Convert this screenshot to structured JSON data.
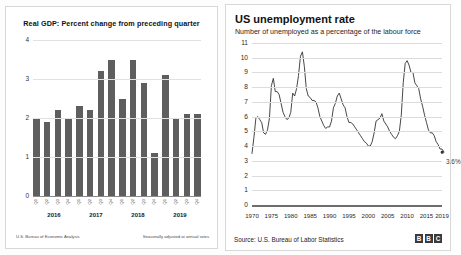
{
  "gdp": {
    "title": "Real GDP: Percent change from preceding quarter",
    "source_left": "U.S. Bureau of Economic Analysis",
    "source_right": "Seasonally adjusted at annual rates"
  },
  "unemployment": {
    "title": "US unemployment rate",
    "subtitle": "Number of unemployed as a percentage of the labour force",
    "source": "Source: U.S. Bureau of Labor Statistics",
    "logo": [
      "B",
      "B",
      "C"
    ],
    "end_label": "3.6%"
  },
  "chart_data": [
    {
      "type": "bar",
      "title": "Real GDP: Percent change from preceding quarter",
      "xlabel": "",
      "ylabel": "",
      "ylim": [
        0,
        4
      ],
      "yticks": [
        0,
        1,
        2,
        3,
        4
      ],
      "grid": true,
      "quarters": [
        "Q1",
        "Q2",
        "Q3",
        "Q4",
        "Q1",
        "Q2",
        "Q3",
        "Q4",
        "Q1",
        "Q2",
        "Q3",
        "Q4",
        "Q1",
        "Q2",
        "Q3",
        "Q4"
      ],
      "years": [
        "2016",
        "2017",
        "2018",
        "2019"
      ],
      "categories": [
        "2016 Q1",
        "2016 Q2",
        "2016 Q3",
        "2016 Q4",
        "2017 Q1",
        "2017 Q2",
        "2017 Q3",
        "2017 Q4",
        "2018 Q1",
        "2018 Q2",
        "2018 Q3",
        "2018 Q4",
        "2019 Q1",
        "2019 Q2",
        "2019 Q3",
        "2019 Q4"
      ],
      "values": [
        2.0,
        1.9,
        2.2,
        2.0,
        2.3,
        2.2,
        3.2,
        3.5,
        2.5,
        3.5,
        2.9,
        1.1,
        3.1,
        2.0,
        2.1,
        2.1
      ],
      "bar_color": "#5e5e5e"
    },
    {
      "type": "line",
      "title": "US unemployment rate",
      "subtitle": "Number of unemployed as a percentage of the labour force",
      "xlabel": "",
      "ylabel": "",
      "ylim": [
        0,
        11
      ],
      "yticks": [
        0,
        1,
        2,
        3,
        4,
        5,
        6,
        7,
        8,
        9,
        10,
        11
      ],
      "xlim": [
        1970,
        2019
      ],
      "xticks": [
        1970,
        1975,
        1980,
        1985,
        1990,
        1995,
        2000,
        2005,
        2010,
        2015,
        2019
      ],
      "grid": true,
      "line_color": "#333333",
      "annotation": {
        "x": 2019,
        "y": 3.6,
        "text": "3.6%"
      },
      "x": [
        1970,
        1970.5,
        1971,
        1971.5,
        1972,
        1972.5,
        1973,
        1973.5,
        1974,
        1974.5,
        1975,
        1975.5,
        1976,
        1976.5,
        1977,
        1977.5,
        1978,
        1978.5,
        1979,
        1979.5,
        1980,
        1980.5,
        1981,
        1981.5,
        1982,
        1982.5,
        1983,
        1983.5,
        1984,
        1984.5,
        1985,
        1985.5,
        1986,
        1986.5,
        1987,
        1987.5,
        1988,
        1988.5,
        1989,
        1989.5,
        1990,
        1990.5,
        1991,
        1991.5,
        1992,
        1992.5,
        1993,
        1993.5,
        1994,
        1994.5,
        1995,
        1995.5,
        1996,
        1996.5,
        1997,
        1997.5,
        1998,
        1998.5,
        1999,
        1999.5,
        2000,
        2000.5,
        2001,
        2001.5,
        2002,
        2002.5,
        2003,
        2003.5,
        2004,
        2004.5,
        2005,
        2005.5,
        2006,
        2006.5,
        2007,
        2007.5,
        2008,
        2008.5,
        2009,
        2009.5,
        2010,
        2010.5,
        2011,
        2011.5,
        2012,
        2012.5,
        2013,
        2013.5,
        2014,
        2014.5,
        2015,
        2015.5,
        2016,
        2016.5,
        2017,
        2017.5,
        2018,
        2018.5,
        2019,
        2019.5
      ],
      "y": [
        3.5,
        4.6,
        5.9,
        6.0,
        5.8,
        5.6,
        4.9,
        4.8,
        5.1,
        5.9,
        8.1,
        8.6,
        7.7,
        7.7,
        7.5,
        6.9,
        6.3,
        6.0,
        5.8,
        5.9,
        6.3,
        7.6,
        7.4,
        7.9,
        8.8,
        10.1,
        10.4,
        9.4,
        7.9,
        7.4,
        7.3,
        7.1,
        7.1,
        7.0,
        6.6,
        6.0,
        5.7,
        5.4,
        5.2,
        5.3,
        5.3,
        5.7,
        6.6,
        6.9,
        7.4,
        7.6,
        7.2,
        6.8,
        6.6,
        6.0,
        5.6,
        5.6,
        5.5,
        5.3,
        5.1,
        4.9,
        4.7,
        4.5,
        4.3,
        4.2,
        4.0,
        4.0,
        4.3,
        4.9,
        5.7,
        5.8,
        5.9,
        6.2,
        5.7,
        5.5,
        5.3,
        5.0,
        4.8,
        4.6,
        4.5,
        4.7,
        5.0,
        6.1,
        8.3,
        9.6,
        9.8,
        9.5,
        9.0,
        9.0,
        8.3,
        8.1,
        7.9,
        7.2,
        6.7,
        6.1,
        5.6,
        5.1,
        4.9,
        4.9,
        4.7,
        4.3,
        4.1,
        3.8,
        3.8,
        3.6
      ]
    }
  ]
}
